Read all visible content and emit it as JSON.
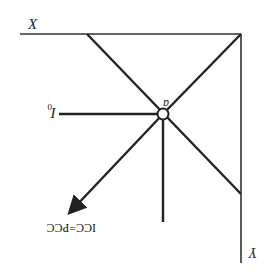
{
  "diagram": {
    "orientation": "rotated-180",
    "labels": {
      "x_axis": "X",
      "y_axis": "Y",
      "point": "a",
      "indifference": "I",
      "indifference_sub": "0",
      "curve": "ICC=PCC"
    },
    "colors": {
      "line": "#222222",
      "background": "#ffffff"
    }
  }
}
